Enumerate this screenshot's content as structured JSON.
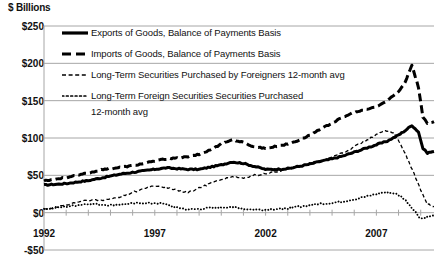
{
  "chart_data": {
    "type": "line",
    "title": "",
    "ylabel": "$ Billions",
    "xlabel": "",
    "ylim": [
      -50,
      250
    ],
    "xlim": [
      1992,
      2009.6
    ],
    "grid": true,
    "legend_position": "top-left",
    "y_ticks": [
      "$250",
      "$200",
      "$150",
      "$100",
      "$50",
      "$0",
      "-$50"
    ],
    "y_tick_values": [
      250,
      200,
      150,
      100,
      50,
      0,
      -50
    ],
    "x_ticks": [
      "1992",
      "1997",
      "2002",
      "2007"
    ],
    "x_tick_values": [
      1992,
      1997,
      2002,
      2007
    ],
    "series": [
      {
        "name": "Exports of Goods, Balance of Payments Basis",
        "style": "solid-thick",
        "x": [
          1992.0,
          1992.5,
          1993.0,
          1993.5,
          1994.0,
          1994.5,
          1995.0,
          1995.5,
          1996.0,
          1996.5,
          1997.0,
          1997.5,
          1998.0,
          1998.5,
          1999.0,
          1999.5,
          2000.0,
          2000.5,
          2001.0,
          2001.5,
          2002.0,
          2002.5,
          2003.0,
          2003.5,
          2004.0,
          2004.5,
          2005.0,
          2005.5,
          2006.0,
          2006.5,
          2007.0,
          2007.5,
          2008.0,
          2008.3,
          2008.6,
          2008.9,
          2009.1,
          2009.3,
          2009.6
        ],
        "values": [
          37,
          38,
          39,
          41,
          43,
          46,
          49,
          52,
          54,
          56,
          58,
          60,
          59,
          58,
          58,
          61,
          64,
          68,
          66,
          62,
          58,
          58,
          59,
          62,
          65,
          69,
          72,
          76,
          81,
          86,
          91,
          96,
          104,
          110,
          117,
          108,
          86,
          80,
          82
        ]
      },
      {
        "name": "Imports of Goods, Balance of Payments Basis",
        "style": "dashed-thick",
        "x": [
          1992.0,
          1992.5,
          1993.0,
          1993.5,
          1994.0,
          1994.5,
          1995.0,
          1995.5,
          1996.0,
          1996.5,
          1997.0,
          1997.5,
          1998.0,
          1998.5,
          1999.0,
          1999.5,
          2000.0,
          2000.5,
          2001.0,
          2001.5,
          2002.0,
          2002.5,
          2003.0,
          2003.5,
          2004.0,
          2004.5,
          2005.0,
          2005.5,
          2006.0,
          2006.5,
          2007.0,
          2007.5,
          2008.0,
          2008.3,
          2008.6,
          2008.9,
          2009.1,
          2009.3,
          2009.6
        ],
        "values": [
          43,
          45,
          47,
          50,
          53,
          57,
          59,
          61,
          63,
          66,
          69,
          72,
          73,
          75,
          78,
          84,
          92,
          98,
          94,
          88,
          86,
          89,
          92,
          97,
          104,
          112,
          120,
          128,
          134,
          138,
          142,
          150,
          162,
          175,
          198,
          168,
          128,
          120,
          122
        ]
      },
      {
        "name": "Long-Term Securities Purchased by Foreigners 12-month avg",
        "style": "dashed-thin",
        "x": [
          1992.0,
          1992.5,
          1993.0,
          1993.5,
          1994.0,
          1994.5,
          1995.0,
          1995.5,
          1996.0,
          1996.5,
          1997.0,
          1997.5,
          1998.0,
          1998.5,
          1999.0,
          1999.5,
          2000.0,
          2000.5,
          2001.0,
          2001.5,
          2002.0,
          2002.5,
          2003.0,
          2003.5,
          2004.0,
          2004.5,
          2005.0,
          2005.5,
          2006.0,
          2006.5,
          2007.0,
          2007.4,
          2007.8,
          2008.1,
          2008.4,
          2008.7,
          2009.0,
          2009.3,
          2009.6
        ],
        "values": [
          5,
          7,
          10,
          14,
          17,
          16,
          18,
          22,
          27,
          32,
          36,
          34,
          30,
          27,
          33,
          39,
          45,
          48,
          46,
          50,
          52,
          55,
          58,
          62,
          66,
          70,
          74,
          80,
          88,
          96,
          104,
          110,
          106,
          92,
          72,
          52,
          30,
          12,
          8
        ]
      },
      {
        "name": "Long-Term Foreign Securities Securities Purchased 12-month avg",
        "style": "dotted-thin",
        "x": [
          1992.0,
          1992.5,
          1993.0,
          1993.5,
          1994.0,
          1994.5,
          1995.0,
          1995.5,
          1996.0,
          1996.5,
          1997.0,
          1997.5,
          1998.0,
          1998.5,
          1999.0,
          1999.5,
          2000.0,
          2000.5,
          2001.0,
          2001.5,
          2002.0,
          2002.5,
          2003.0,
          2003.5,
          2004.0,
          2004.5,
          2005.0,
          2005.5,
          2006.0,
          2006.5,
          2007.0,
          2007.4,
          2007.8,
          2008.1,
          2008.4,
          2008.7,
          2009.0,
          2009.3,
          2009.6
        ],
        "values": [
          5,
          6,
          8,
          10,
          12,
          11,
          10,
          11,
          12,
          13,
          13,
          11,
          7,
          4,
          5,
          6,
          7,
          8,
          5,
          4,
          4,
          5,
          6,
          8,
          10,
          12,
          13,
          15,
          18,
          21,
          25,
          27,
          26,
          22,
          14,
          3,
          -8,
          -6,
          -4
        ]
      }
    ]
  },
  "legend": {
    "items": [
      {
        "label": "Exports of Goods, Balance of Payments Basis",
        "style": "solid-thick"
      },
      {
        "label": "Imports of Goods, Balance of Payments Basis",
        "style": "dashed-thick"
      },
      {
        "label": "Long-Term Securities Purchased by Foreigners 12-month avg",
        "style": "dashed-thin"
      },
      {
        "label": "Long-Term Foreign Securities Securities Purchased",
        "style": "dotted-thin"
      }
    ],
    "continuation": "12-month avg"
  },
  "colors": {
    "series": "#000000",
    "grid": "#a6a6a6",
    "text": "#111111",
    "background": "#ffffff"
  }
}
